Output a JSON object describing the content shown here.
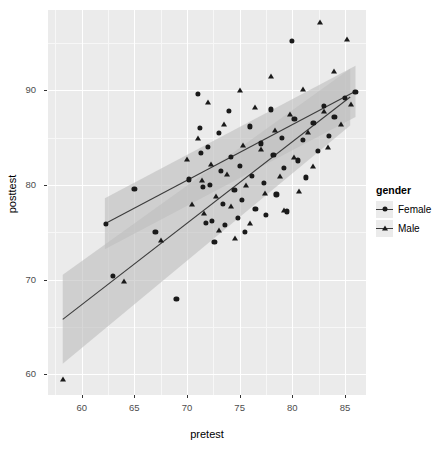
{
  "chart_data": {
    "type": "scatter",
    "title": "",
    "xlabel": "pretest",
    "ylabel": "posttest",
    "xlim": [
      56.8,
      87.0
    ],
    "ylim": [
      57.8,
      98.5
    ],
    "xticks": [
      60,
      65,
      70,
      75,
      80,
      85
    ],
    "yticks": [
      60,
      70,
      80,
      90
    ],
    "xtick_labels": [
      "60",
      "65",
      "70",
      "75",
      "80",
      "85"
    ],
    "ytick_labels": [
      "60",
      "70",
      "80",
      "90"
    ],
    "grid": true,
    "grid_major_color": "#FFFFFF",
    "panel_background": "#EBEBEB",
    "legend": {
      "title": "gender",
      "position": "right",
      "entries": [
        {
          "label": "Female",
          "shape": "circle",
          "color": "#1A1A1A"
        },
        {
          "label": "Male",
          "shape": "triangle",
          "color": "#1A1A1A"
        }
      ]
    },
    "series": [
      {
        "name": "Female",
        "shape": "circle",
        "color": "#1A1A1A",
        "fit": {
          "type": "linear",
          "x_start": 62.2,
          "y_start": 75.9,
          "x_end": 86.0,
          "y_end": 89.9,
          "ci_upper_start": 78.6,
          "ci_lower_start": 73.2,
          "ci_upper_end": 92.6,
          "ci_lower_end": 87.2,
          "band_color": "#BFBFBF",
          "line_color": "#3C3C3C"
        },
        "points": [
          [
            62.3,
            75.9
          ],
          [
            63.0,
            70.4
          ],
          [
            65.0,
            79.6
          ],
          [
            67.0,
            75.0
          ],
          [
            69.0,
            68.0
          ],
          [
            70.2,
            80.6
          ],
          [
            71.0,
            89.6
          ],
          [
            71.2,
            86.0
          ],
          [
            71.3,
            83.4
          ],
          [
            71.5,
            79.8
          ],
          [
            71.8,
            76.0
          ],
          [
            72.0,
            84.0
          ],
          [
            72.2,
            80.0
          ],
          [
            72.4,
            76.2
          ],
          [
            72.6,
            74.0
          ],
          [
            73.0,
            85.5
          ],
          [
            73.2,
            81.5
          ],
          [
            73.4,
            78.0
          ],
          [
            73.6,
            75.8
          ],
          [
            74.0,
            87.8
          ],
          [
            74.2,
            83.0
          ],
          [
            74.5,
            79.5
          ],
          [
            74.8,
            76.5
          ],
          [
            75.0,
            82.0
          ],
          [
            75.2,
            78.4
          ],
          [
            75.5,
            75.0
          ],
          [
            76.0,
            86.2
          ],
          [
            76.2,
            81.0
          ],
          [
            76.5,
            77.5
          ],
          [
            77.0,
            84.4
          ],
          [
            77.3,
            80.2
          ],
          [
            77.5,
            76.8
          ],
          [
            78.0,
            88.0
          ],
          [
            78.2,
            83.2
          ],
          [
            78.5,
            79.0
          ],
          [
            79.0,
            85.0
          ],
          [
            79.2,
            81.8
          ],
          [
            79.5,
            77.2
          ],
          [
            80.0,
            95.2
          ],
          [
            80.2,
            87.0
          ],
          [
            80.5,
            82.6
          ],
          [
            81.0,
            84.8
          ],
          [
            81.3,
            80.8
          ],
          [
            82.0,
            86.6
          ],
          [
            82.4,
            83.6
          ],
          [
            83.0,
            88.4
          ],
          [
            83.5,
            85.2
          ],
          [
            84.0,
            87.2
          ],
          [
            85.0,
            89.2
          ],
          [
            86.0,
            89.8
          ]
        ]
      },
      {
        "name": "Male",
        "shape": "triangle",
        "color": "#1A1A1A",
        "fit": {
          "type": "linear",
          "x_start": 58.2,
          "y_start": 65.8,
          "x_end": 85.5,
          "y_end": 89.3,
          "ci_upper_start": 70.5,
          "ci_lower_start": 61.1,
          "ci_upper_end": 92.3,
          "ci_lower_end": 86.3,
          "band_color": "#BFBFBF",
          "line_color": "#3C3C3C"
        },
        "points": [
          [
            58.2,
            59.5
          ],
          [
            64.0,
            69.8
          ],
          [
            67.5,
            74.2
          ],
          [
            70.0,
            82.8
          ],
          [
            70.5,
            78.0
          ],
          [
            71.0,
            85.0
          ],
          [
            71.4,
            80.5
          ],
          [
            71.6,
            77.0
          ],
          [
            72.0,
            88.8
          ],
          [
            72.3,
            82.2
          ],
          [
            72.8,
            78.8
          ],
          [
            73.0,
            75.2
          ],
          [
            73.5,
            86.5
          ],
          [
            73.8,
            81.2
          ],
          [
            74.2,
            77.8
          ],
          [
            74.6,
            74.4
          ],
          [
            75.0,
            90.0
          ],
          [
            75.3,
            84.2
          ],
          [
            75.6,
            80.0
          ],
          [
            76.0,
            76.0
          ],
          [
            76.5,
            88.2
          ],
          [
            77.0,
            83.8
          ],
          [
            77.4,
            79.2
          ],
          [
            78.0,
            91.5
          ],
          [
            78.4,
            85.8
          ],
          [
            78.8,
            81.0
          ],
          [
            79.2,
            77.4
          ],
          [
            79.8,
            87.5
          ],
          [
            80.2,
            83.0
          ],
          [
            80.6,
            79.4
          ],
          [
            81.0,
            90.2
          ],
          [
            81.5,
            85.6
          ],
          [
            82.0,
            82.0
          ],
          [
            82.6,
            97.2
          ],
          [
            83.0,
            87.8
          ],
          [
            83.4,
            84.0
          ],
          [
            84.0,
            92.0
          ],
          [
            84.6,
            86.4
          ],
          [
            85.2,
            95.4
          ],
          [
            85.6,
            88.6
          ]
        ]
      }
    ]
  }
}
